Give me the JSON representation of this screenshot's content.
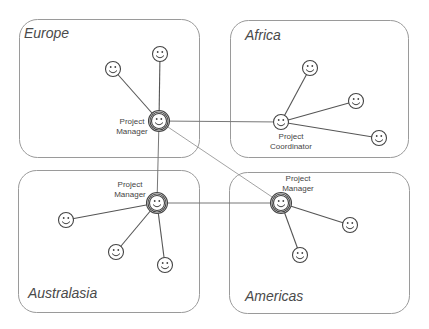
{
  "diagram": {
    "type": "organizational-network",
    "regions": [
      {
        "id": "europe",
        "title": "Europe",
        "box": {
          "x": 19,
          "y": 19,
          "w": 180,
          "h": 138
        },
        "title_pos": {
          "x": 24,
          "y": 38
        }
      },
      {
        "id": "africa",
        "title": "Africa",
        "box": {
          "x": 230,
          "y": 20,
          "w": 178,
          "h": 137
        },
        "title_pos": {
          "x": 245,
          "y": 40
        }
      },
      {
        "id": "australasia",
        "title": "Australasia",
        "box": {
          "x": 18,
          "y": 170,
          "w": 181,
          "h": 142
        },
        "title_pos": {
          "x": 28,
          "y": 298
        }
      },
      {
        "id": "americas",
        "title": "Americas",
        "box": {
          "x": 229,
          "y": 172,
          "w": 180,
          "h": 141
        },
        "title_pos": {
          "x": 245,
          "y": 301
        }
      }
    ],
    "nodes": [
      {
        "id": "eu_pm",
        "region": "europe",
        "role": "manager",
        "x": 159,
        "y": 121,
        "label": [
          "Project",
          "Manager"
        ],
        "label_pos": {
          "x": 132,
          "y": 124
        }
      },
      {
        "id": "eu_1",
        "region": "europe",
        "role": "member",
        "x": 160,
        "y": 54
      },
      {
        "id": "eu_2",
        "region": "europe",
        "role": "member",
        "x": 113,
        "y": 69
      },
      {
        "id": "af_pc",
        "region": "africa",
        "role": "coordinator",
        "x": 281,
        "y": 122,
        "label": [
          "Project",
          "Coordinator"
        ],
        "label_pos": {
          "x": 291,
          "y": 139
        }
      },
      {
        "id": "af_1",
        "region": "africa",
        "role": "member",
        "x": 310,
        "y": 68
      },
      {
        "id": "af_2",
        "region": "africa",
        "role": "member",
        "x": 356,
        "y": 101
      },
      {
        "id": "af_3",
        "region": "africa",
        "role": "member",
        "x": 379,
        "y": 138
      },
      {
        "id": "au_pm",
        "region": "australasia",
        "role": "manager",
        "x": 157,
        "y": 203,
        "label": [
          "Project",
          "Manager"
        ],
        "label_pos": {
          "x": 130,
          "y": 187
        }
      },
      {
        "id": "au_1",
        "region": "australasia",
        "role": "member",
        "x": 66,
        "y": 220
      },
      {
        "id": "au_2",
        "region": "australasia",
        "role": "member",
        "x": 116,
        "y": 252
      },
      {
        "id": "au_3",
        "region": "australasia",
        "role": "member",
        "x": 165,
        "y": 265
      },
      {
        "id": "am_pm",
        "region": "americas",
        "role": "manager",
        "x": 281,
        "y": 203,
        "label": [
          "Project",
          "Manager"
        ],
        "label_pos": {
          "x": 298,
          "y": 181
        }
      },
      {
        "id": "am_1",
        "region": "americas",
        "role": "member",
        "x": 350,
        "y": 225
      },
      {
        "id": "am_2",
        "region": "americas",
        "role": "member",
        "x": 300,
        "y": 255
      }
    ],
    "links": [
      {
        "from": "eu_pm",
        "to": "eu_1",
        "kind": "intra"
      },
      {
        "from": "eu_pm",
        "to": "eu_2",
        "kind": "intra"
      },
      {
        "from": "af_pc",
        "to": "af_1",
        "kind": "intra"
      },
      {
        "from": "af_pc",
        "to": "af_2",
        "kind": "intra"
      },
      {
        "from": "af_pc",
        "to": "af_3",
        "kind": "intra"
      },
      {
        "from": "au_pm",
        "to": "au_1",
        "kind": "intra"
      },
      {
        "from": "au_pm",
        "to": "au_2",
        "kind": "intra"
      },
      {
        "from": "au_pm",
        "to": "au_3",
        "kind": "intra"
      },
      {
        "from": "am_pm",
        "to": "am_1",
        "kind": "intra"
      },
      {
        "from": "am_pm",
        "to": "am_2",
        "kind": "intra"
      },
      {
        "from": "eu_pm",
        "to": "af_pc",
        "kind": "inter"
      },
      {
        "from": "eu_pm",
        "to": "au_pm",
        "kind": "inter"
      },
      {
        "from": "eu_pm",
        "to": "am_pm",
        "kind": "inter-faint"
      },
      {
        "from": "au_pm",
        "to": "am_pm",
        "kind": "inter"
      }
    ],
    "icons": {
      "member": "smiley-face-icon",
      "manager": "double-ring-smiley-icon",
      "coordinator": "smiley-face-icon"
    }
  }
}
